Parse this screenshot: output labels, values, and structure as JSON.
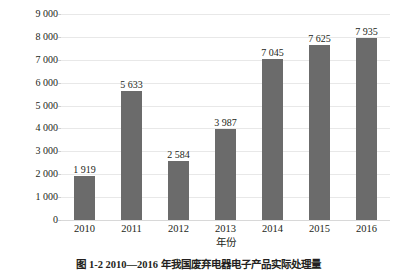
{
  "chart_data": {
    "type": "bar",
    "title": "",
    "xlabel": "年份",
    "ylabel": "实际处理量/万台",
    "categories": [
      "2010",
      "2011",
      "2012",
      "2013",
      "2014",
      "2015",
      "2016"
    ],
    "values": [
      1919,
      5633,
      2584,
      3987,
      7045,
      7625,
      7935
    ],
    "value_labels": [
      "1 919",
      "5 633",
      "2 584",
      "3 987",
      "7 045",
      "7 625",
      "7 935"
    ],
    "ylim": [
      0,
      9000
    ],
    "ytick_values": [
      0,
      1000,
      2000,
      3000,
      4000,
      5000,
      6000,
      7000,
      8000,
      9000
    ],
    "ytick_labels": [
      "0",
      "1 000",
      "2 000",
      "3 000",
      "4 000",
      "5 000",
      "6 000",
      "7 000",
      "8 000",
      "9 000"
    ],
    "grid": true,
    "legend": false,
    "series": [
      {
        "name": "实际处理量",
        "values": [
          1919,
          5633,
          2584,
          3987,
          7045,
          7625,
          7935
        ],
        "color": "#6b6b6b"
      }
    ],
    "colors": {
      "bar": "#6b6b6b",
      "gridline": "#e8e8e8",
      "axis": "#d8d8d8",
      "text": "#231f20",
      "background": "#ffffff"
    }
  },
  "caption": {
    "text": "图 1-2  2010—2016 年我国废弃电器电子产品实际处理量"
  }
}
